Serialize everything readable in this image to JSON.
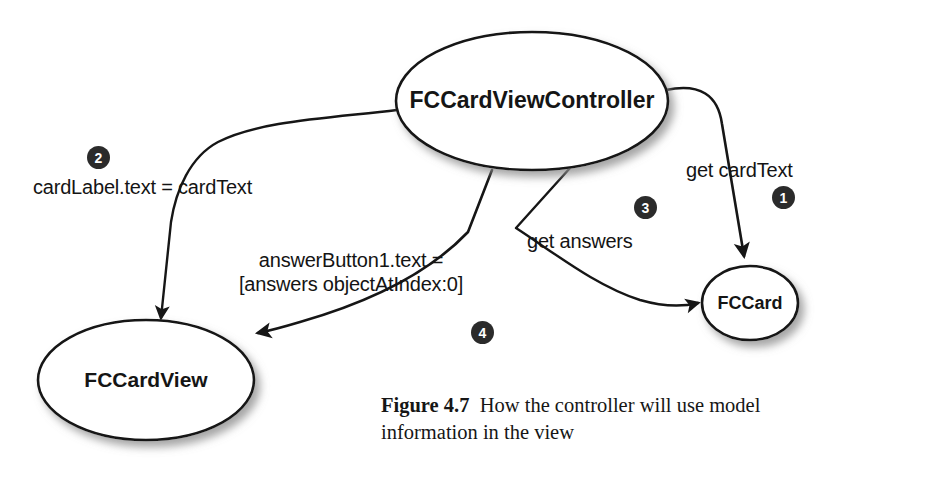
{
  "figure": {
    "caption_label": "Figure 4.7",
    "caption_text": "How the controller will use model information in the view",
    "background_color": "#ffffff",
    "stroke_color": "#141414",
    "badge_color": "#2b2b2b",
    "node_fill": "#ffffff"
  },
  "nodes": [
    {
      "id": "controller",
      "label": "FCCardViewController",
      "shape": "ellipse",
      "cx": 532,
      "cy": 101,
      "rx": 136,
      "ry": 69,
      "font_size": 23
    },
    {
      "id": "cardview",
      "label": "FCCardView",
      "shape": "ellipse",
      "cx": 146,
      "cy": 380,
      "rx": 108,
      "ry": 60,
      "font_size": 21
    },
    {
      "id": "card",
      "label": "FCCard",
      "shape": "ellipse",
      "cx": 750,
      "cy": 303,
      "rx": 48,
      "ry": 37,
      "font_size": 18
    }
  ],
  "edges": [
    {
      "id": "edge-1",
      "step": "1",
      "label": "get cardText",
      "from": "controller",
      "to": "card",
      "label_x": 686,
      "label_y": 158,
      "badge_x": 772,
      "badge_y": 186
    },
    {
      "id": "edge-2",
      "step": "2",
      "label": "cardLabel.text = cardText",
      "from": "controller",
      "to": "cardview",
      "label_x": 33,
      "label_y": 175,
      "badge_x": 87,
      "badge_y": 146
    },
    {
      "id": "edge-3",
      "step": "3",
      "label": "get answers",
      "from": "controller",
      "to": "card",
      "label_x": 527,
      "label_y": 229,
      "badge_x": 634,
      "badge_y": 196
    },
    {
      "id": "edge-4",
      "step": "4",
      "label_line1": "answerButton1.text =",
      "label_line2": "[answers objectAtIndex:0]",
      "from": "controller",
      "to": "cardview",
      "label_x": 239,
      "label_y": 248,
      "badge_x": 471,
      "badge_y": 321
    }
  ]
}
